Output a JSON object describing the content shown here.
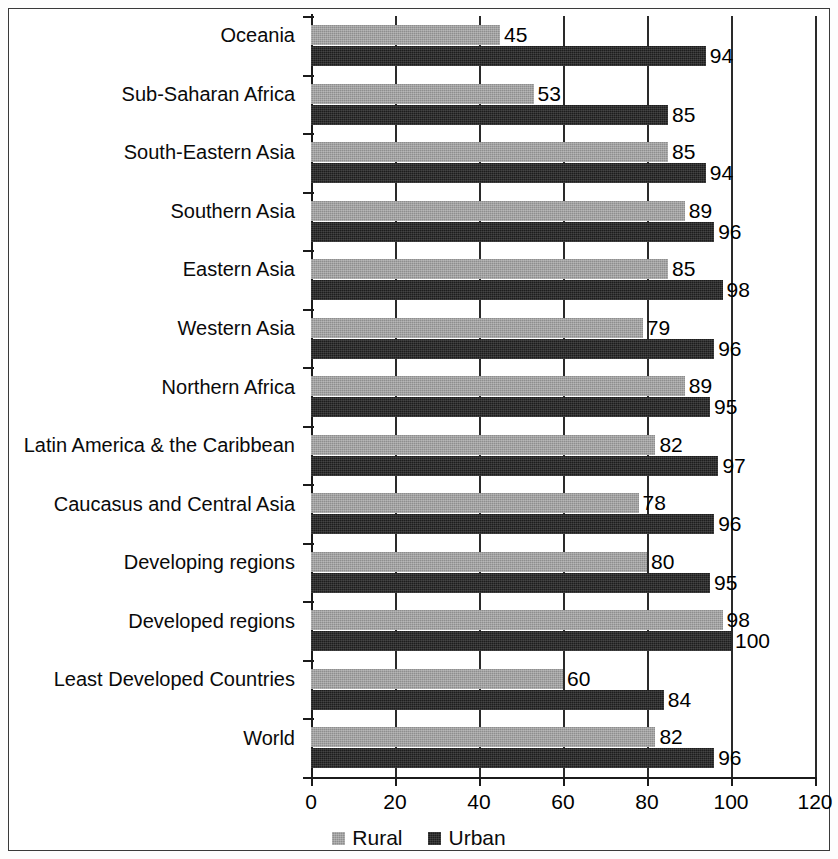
{
  "chart_data": {
    "type": "bar",
    "orientation": "horizontal",
    "title": "",
    "xlabel": "",
    "ylabel": "",
    "xlim": [
      0,
      120
    ],
    "xticks": [
      0,
      20,
      40,
      60,
      80,
      100,
      120
    ],
    "xtick_labels": [
      "0",
      "20",
      "40",
      "60",
      "80",
      "100",
      "120"
    ],
    "grid": true,
    "legend_position": "bottom",
    "categories": [
      "Oceania",
      "Sub-Saharan Africa",
      "South-Eastern Asia",
      "Southern Asia",
      "Eastern Asia",
      "Western Asia",
      "Northern Africa",
      "Latin America & the Caribbean",
      "Caucasus and Central Asia",
      "Developing regions",
      "Developed regions",
      "Least Developed Countries",
      "World"
    ],
    "series": [
      {
        "name": "Rural",
        "color": "#8e8e8e",
        "values": [
          45,
          53,
          85,
          89,
          85,
          79,
          89,
          82,
          78,
          80,
          98,
          60,
          82
        ]
      },
      {
        "name": "Urban",
        "color": "#1d1d1d",
        "values": [
          94,
          85,
          94,
          96,
          98,
          96,
          95,
          97,
          96,
          95,
          100,
          84,
          96
        ]
      }
    ]
  },
  "legend": {
    "items": [
      {
        "label": "Rural",
        "color": "#8e8e8e"
      },
      {
        "label": "Urban",
        "color": "#1d1d1d"
      }
    ]
  }
}
